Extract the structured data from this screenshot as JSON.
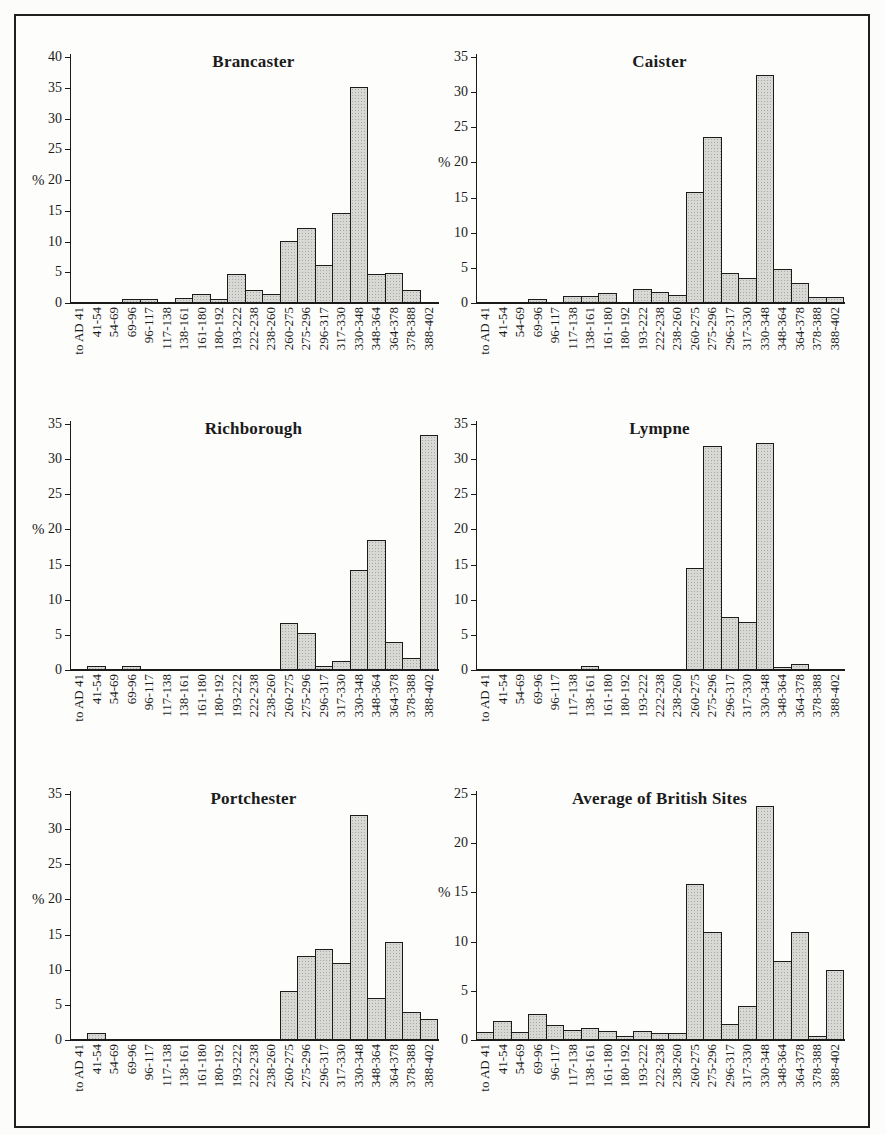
{
  "figure": {
    "description": "Six bar histograms of coin-loss percentages by period for Saxon Shore forts",
    "bar_fill": "#d8d8d4",
    "bar_border": "#1b1b1b",
    "frame_color": "#1f1f1f"
  },
  "chart_data": {
    "type": "bar",
    "ylabel": "%",
    "grid": false,
    "legend": "none",
    "categories": [
      "to AD 41",
      "41-54",
      "54-69",
      "69-96",
      "96-117",
      "117-138",
      "138-161",
      "161-180",
      "180-192",
      "193-222",
      "222-238",
      "238-260",
      "260-275",
      "275-296",
      "296-317",
      "317-330",
      "330-348",
      "348-364",
      "364-378",
      "378-388",
      "388-402"
    ],
    "charts": [
      {
        "title": "Brancaster",
        "slug": "brancaster",
        "ylim": [
          0,
          40
        ],
        "ystep": 5,
        "show_percent": true,
        "percent_at": 20,
        "values": [
          0,
          0.2,
          0,
          0.6,
          0.7,
          0.2,
          0.8,
          1.5,
          0.7,
          4.7,
          2.1,
          1.5,
          10.1,
          12.2,
          6.2,
          14.6,
          35.2,
          4.7,
          4.9,
          2.1,
          0.1
        ]
      },
      {
        "title": "Caister",
        "slug": "caister",
        "ylim": [
          0,
          35
        ],
        "ystep": 5,
        "show_percent": true,
        "percent_at": 20,
        "values": [
          0,
          0,
          0,
          0.5,
          0,
          1.0,
          1.0,
          1.4,
          0,
          2.0,
          1.6,
          1.1,
          15.8,
          23.6,
          4.2,
          3.6,
          32.5,
          4.8,
          2.9,
          0.9,
          0.9
        ]
      },
      {
        "title": "Richborough",
        "slug": "richborough",
        "ylim": [
          0,
          35
        ],
        "ystep": 5,
        "show_percent": true,
        "percent_at": 20,
        "values": [
          0,
          0.6,
          0,
          0.6,
          0,
          0,
          0,
          0,
          0,
          0,
          0,
          0.1,
          6.7,
          5.3,
          0.6,
          1.3,
          14.2,
          18.5,
          4.0,
          1.7,
          33.5
        ]
      },
      {
        "title": "Lympne",
        "slug": "lympne",
        "ylim": [
          0,
          35
        ],
        "ystep": 5,
        "show_percent": false,
        "percent_at": 20,
        "values": [
          0,
          0,
          0,
          0,
          0,
          0,
          0.5,
          0,
          0,
          0,
          0,
          0,
          14.5,
          31.8,
          7.5,
          6.8,
          32.3,
          0.4,
          0.9,
          0,
          0
        ]
      },
      {
        "title": "Portchester",
        "slug": "portchester",
        "ylim": [
          0,
          35
        ],
        "ystep": 5,
        "show_percent": true,
        "percent_at": 20,
        "values": [
          0,
          1.0,
          0,
          0,
          0,
          0,
          0,
          0,
          0,
          0,
          0,
          0,
          7.0,
          12.0,
          13.0,
          11.0,
          32.0,
          6.0,
          14.0,
          4.0,
          3.0
        ]
      },
      {
        "title": "Average of British Sites",
        "slug": "average-of-british-sites",
        "ylim": [
          0,
          25
        ],
        "ystep": 5,
        "show_percent": true,
        "percent_at": 15,
        "values": [
          0.8,
          1.9,
          0.8,
          2.6,
          1.5,
          1.0,
          1.2,
          0.9,
          0.4,
          0.9,
          0.7,
          0.7,
          15.9,
          11.0,
          1.6,
          3.5,
          23.8,
          8.0,
          11.0,
          0.4,
          7.1
        ]
      }
    ]
  }
}
